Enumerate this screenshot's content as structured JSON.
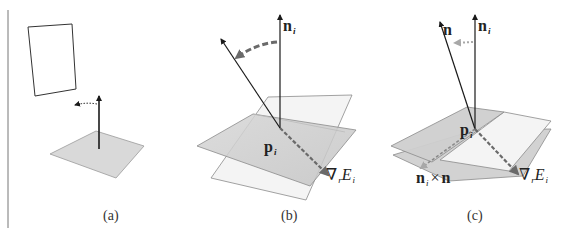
{
  "figure": {
    "panels": [
      {
        "id": "a",
        "caption": "(a)",
        "elements": [
          "image-plane-frame",
          "surface-patch",
          "normal-arrow",
          "rotation-hint-dotted-arrow"
        ]
      },
      {
        "id": "b",
        "caption": "(b)",
        "labels": {
          "normal": "n",
          "normal_sub": "i",
          "point": "p",
          "point_sub": "i",
          "gradient_symbol": "∇",
          "gradient_sub": "r",
          "gradient_E": "E",
          "gradient_E_sub": "i"
        }
      },
      {
        "id": "c",
        "caption": "(c)",
        "labels": {
          "new_normal": "n",
          "normal": "n",
          "normal_sub": "i",
          "point": "p",
          "point_sub": "i",
          "gradient_symbol": "∇",
          "gradient_sub": "r",
          "gradient_E": "E",
          "gradient_E_sub": "i",
          "cross_n": "n",
          "cross_sub": "i",
          "cross_op": "×",
          "cross_n2": "n"
        }
      }
    ],
    "colors": {
      "line": "#1a1a1a",
      "plane_gray": "#cfcfcf",
      "plane_light": "#f1f1f1",
      "plane_edge": "#8a8a8a",
      "dashed_arrow": "#707070",
      "dotted_arrow": "#a8a8a8"
    }
  }
}
